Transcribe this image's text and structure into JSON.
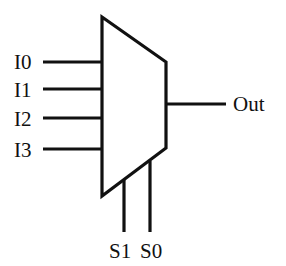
{
  "diagram": {
    "type": "multiplexer",
    "component": "4-to-1 MUX",
    "inputs": [
      {
        "label": "I0"
      },
      {
        "label": "I1"
      },
      {
        "label": "I2"
      },
      {
        "label": "I3"
      }
    ],
    "selects": [
      {
        "label": "S1"
      },
      {
        "label": "S0"
      }
    ],
    "output": {
      "label": "Out"
    },
    "colors": {
      "stroke": "#111111",
      "background": "#ffffff"
    }
  }
}
